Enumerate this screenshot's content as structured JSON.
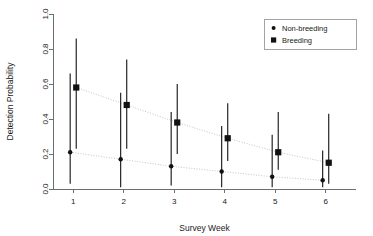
{
  "chart_data": {
    "type": "scatter",
    "title": "",
    "xlabel": "Survey Week",
    "ylabel": "Detection Probability",
    "categories": [
      "1",
      "2",
      "3",
      "4",
      "5",
      "6"
    ],
    "x": [
      1,
      2,
      3,
      4,
      5,
      6
    ],
    "xlim": [
      0.6,
      6.6
    ],
    "ylim": [
      0.0,
      1.0
    ],
    "xticks": [
      "1",
      "2",
      "3",
      "4",
      "5",
      "6"
    ],
    "yticks": [
      "0.0",
      "0.2",
      "0.4",
      "0.6",
      "0.8",
      "1.0"
    ],
    "ytick_values": [
      0.0,
      0.2,
      0.4,
      0.6,
      0.8,
      1.0
    ],
    "grid": false,
    "legend_position": "top-right",
    "error_bar_type": "95% confidence interval",
    "series": [
      {
        "name": "Non-breeding",
        "marker": "circle",
        "color": "#111111",
        "x_offset": -0.06,
        "values": [
          0.21,
          0.17,
          0.13,
          0.1,
          0.07,
          0.05
        ],
        "lower": [
          0.03,
          0.01,
          0.02,
          0.01,
          0.01,
          0.01
        ],
        "upper": [
          0.66,
          0.55,
          0.44,
          0.36,
          0.31,
          0.22
        ]
      },
      {
        "name": "Breeding",
        "marker": "square",
        "color": "#111111",
        "x_offset": 0.06,
        "values": [
          0.58,
          0.48,
          0.38,
          0.29,
          0.21,
          0.15
        ],
        "lower": [
          0.23,
          0.23,
          0.2,
          0.16,
          0.11,
          0.03
        ],
        "upper": [
          0.86,
          0.74,
          0.6,
          0.49,
          0.44,
          0.43
        ]
      }
    ]
  },
  "legend": {
    "entries": [
      {
        "label": "Non-breeding",
        "marker": "circle"
      },
      {
        "label": "Breeding",
        "marker": "square"
      }
    ]
  }
}
